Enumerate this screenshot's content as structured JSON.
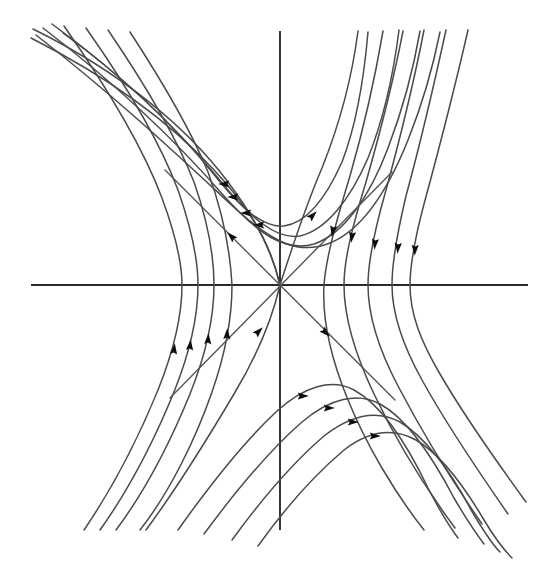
{
  "figure": {
    "type": "phase-portrait",
    "background_color": "#ffffff",
    "axis_color": "#2b2b2b",
    "curve_color": "#4a4a4a",
    "arrow_color": "#0d0d0d"
  },
  "chart_data": {
    "type": "line",
    "title": "",
    "subtitle": "",
    "xlabel": "",
    "ylabel": "",
    "grid": false,
    "legend": null,
    "annotations": [],
    "axes": {
      "horizontal": {
        "x1": 31,
        "y1": 285,
        "x2": 528,
        "y2": 285
      },
      "vertical": {
        "x1": 280,
        "y1": 31,
        "x2": 280,
        "y2": 530
      },
      "origin": {
        "x": 280,
        "y": 285
      },
      "xlim": [
        -1,
        1
      ],
      "ylim": [
        -1,
        1
      ],
      "xticks": [],
      "yticks": []
    },
    "separatrices": [
      {
        "name": "stable-separatrix",
        "direction": "inbound",
        "path": "M 165,170 L 395,400",
        "arrows": [
          {
            "x": 232,
            "y": 237,
            "angle": 225
          },
          {
            "x": 325,
            "y": 332,
            "angle": 45
          }
        ]
      },
      {
        "name": "unstable-separatrix",
        "direction": "outbound",
        "path": "M 170,398 L 392,172",
        "arrows": [
          {
            "x": 312,
            "y": 216,
            "angle": 315
          },
          {
            "x": 258,
            "y": 332,
            "angle": 315
          }
        ]
      }
    ],
    "series": [
      {
        "name": "upper-left-inflow-1",
        "quadrant": "upper",
        "path": "M 31,38 C 110,78 170,122 214,170 C 252,210 272,248 280,285",
        "arrows": []
      },
      {
        "name": "upper-left-inflow-2",
        "quadrant": "upper",
        "path": "M 33,29 C 120,72 186,126 228,182 C 258,222 272,252 280,285",
        "arrows": []
      },
      {
        "name": "upper-branch-1",
        "quadrant": "upper",
        "path": "M 36,35 C 120,100 186,163 237,210 C 275,244 300,255 330,243 C 362,230 388,190 408,140 C 424,100 434,62 440,32",
        "arrows": [
          {
            "x": 260,
            "y": 225,
            "angle": 180
          }
        ]
      },
      {
        "name": "upper-branch-2",
        "quadrant": "upper",
        "path": "M 43,28 C 124,90 184,150 224,196 C 260,236 286,252 314,244 C 344,234 370,196 388,148 C 404,106 414,66 420,31",
        "arrows": [
          {
            "x": 247,
            "y": 213,
            "angle": 180
          }
        ]
      },
      {
        "name": "upper-branch-3",
        "quadrant": "upper",
        "path": "M 52,24 C 126,78 180,132 218,178 C 250,218 276,240 300,236 C 326,230 350,200 368,158 C 384,118 394,70 399,30",
        "arrows": [
          {
            "x": 234,
            "y": 197,
            "angle": 180
          }
        ]
      },
      {
        "name": "upper-branch-4",
        "quadrant": "upper",
        "path": "M 63,33 C 130,82 178,130 212,172 C 242,210 264,228 284,226 C 306,223 326,198 342,162 C 356,126 364,78 368,32",
        "arrows": [
          {
            "x": 225,
            "y": 184,
            "angle": 180
          }
        ]
      },
      {
        "name": "upper-right-outflow-1",
        "quadrant": "upper-right",
        "path": "M 280,285 C 292,248 304,210 322,168 C 338,128 352,78 358,31",
        "arrows": []
      },
      {
        "name": "right-branch-1",
        "quadrant": "right",
        "path": "M 383,31 C 374,84 362,134 350,176 C 336,222 326,258 324,285 C 322,318 330,356 348,400 C 366,444 394,492 424,530",
        "arrows": [
          {
            "x": 333,
            "y": 230,
            "angle": 100
          }
        ]
      },
      {
        "name": "right-branch-2",
        "quadrant": "right",
        "path": "M 403,31 C 392,88 378,140 366,182 C 352,228 344,260 344,285 C 344,318 354,352 374,394 C 394,436 424,486 455,528",
        "arrows": [
          {
            "x": 352,
            "y": 236,
            "angle": 97
          }
        ]
      },
      {
        "name": "right-branch-3",
        "quadrant": "right",
        "path": "M 424,30 C 412,92 398,146 386,190 C 374,232 368,262 368,285 C 368,316 378,348 398,386 C 420,428 450,478 482,524",
        "arrows": [
          {
            "x": 375,
            "y": 243,
            "angle": 95
          }
        ]
      },
      {
        "name": "right-branch-4",
        "quadrant": "right",
        "path": "M 446,30 C 432,94 418,152 406,196 C 396,238 392,264 392,285 C 392,314 402,344 422,380 C 444,420 476,468 508,514",
        "arrows": [
          {
            "x": 398,
            "y": 247,
            "angle": 94
          }
        ]
      },
      {
        "name": "right-branch-5",
        "quadrant": "right",
        "path": "M 468,30 C 452,100 436,160 424,204 C 414,242 410,266 410,285 C 410,313 420,340 440,374 C 462,412 494,458 526,502",
        "arrows": [
          {
            "x": 415,
            "y": 249,
            "angle": 93
          }
        ]
      },
      {
        "name": "left-branch-1",
        "quadrant": "left",
        "path": "M 130,32 C 160,78 190,128 208,172 C 222,210 230,248 232,285 C 232,316 226,352 212,392 C 196,438 170,492 140,530",
        "arrows": [
          {
            "x": 227,
            "y": 335,
            "angle": 272
          }
        ]
      },
      {
        "name": "left-branch-2",
        "quadrant": "left",
        "path": "M 108,30 C 142,80 176,136 194,182 C 208,222 214,256 214,285 C 214,318 206,354 190,394 C 172,438 146,490 116,530",
        "arrows": [
          {
            "x": 208,
            "y": 340,
            "angle": 274
          }
        ]
      },
      {
        "name": "left-branch-3",
        "quadrant": "left",
        "path": "M 86,28 C 124,82 160,142 178,190 C 192,230 198,260 198,285 C 198,318 190,352 174,392 C 156,436 130,488 100,530",
        "arrows": [
          {
            "x": 190,
            "y": 346,
            "angle": 276
          }
        ]
      },
      {
        "name": "left-branch-4",
        "quadrant": "left",
        "path": "M 64,26 C 106,86 144,150 162,198 C 176,236 182,264 182,285 C 182,316 174,350 158,390 C 140,434 114,486 84,530",
        "arrows": [
          {
            "x": 174,
            "y": 350,
            "angle": 277
          }
        ]
      },
      {
        "name": "lower-left-outflow-1",
        "quadrant": "lower",
        "path": "M 280,285 C 272,320 258,354 234,394 C 208,438 174,492 146,530",
        "arrows": []
      },
      {
        "name": "lower-branch-1",
        "quadrant": "lower",
        "path": "M 178,530 C 212,482 246,440 276,412 C 304,386 332,378 354,390 C 380,404 406,442 428,488 C 442,515 452,530 458,538",
        "arrows": [
          {
            "x": 302,
            "y": 396,
            "angle": 0
          }
        ]
      },
      {
        "name": "lower-branch-2",
        "quadrant": "lower",
        "path": "M 204,534 C 238,488 272,448 302,422 C 330,398 358,392 380,404 C 406,418 432,456 454,498 C 468,522 478,536 484,544",
        "arrows": [
          {
            "x": 328,
            "y": 408,
            "angle": 0
          }
        ]
      },
      {
        "name": "lower-branch-3",
        "quadrant": "lower",
        "path": "M 232,540 C 264,496 296,460 324,436 C 352,414 378,410 400,422 C 424,436 450,470 470,508 C 484,532 494,546 500,552",
        "arrows": [
          {
            "x": 352,
            "y": 422,
            "angle": 0
          }
        ]
      },
      {
        "name": "lower-branch-4",
        "quadrant": "lower",
        "path": "M 258,546 C 288,504 318,472 344,450 C 370,430 394,428 416,440 C 440,454 464,486 484,520 C 496,540 506,552 512,558",
        "arrows": [
          {
            "x": 374,
            "y": 436,
            "angle": 0
          }
        ]
      }
    ],
    "arrow_count": 16,
    "trajectory_count": 22
  }
}
